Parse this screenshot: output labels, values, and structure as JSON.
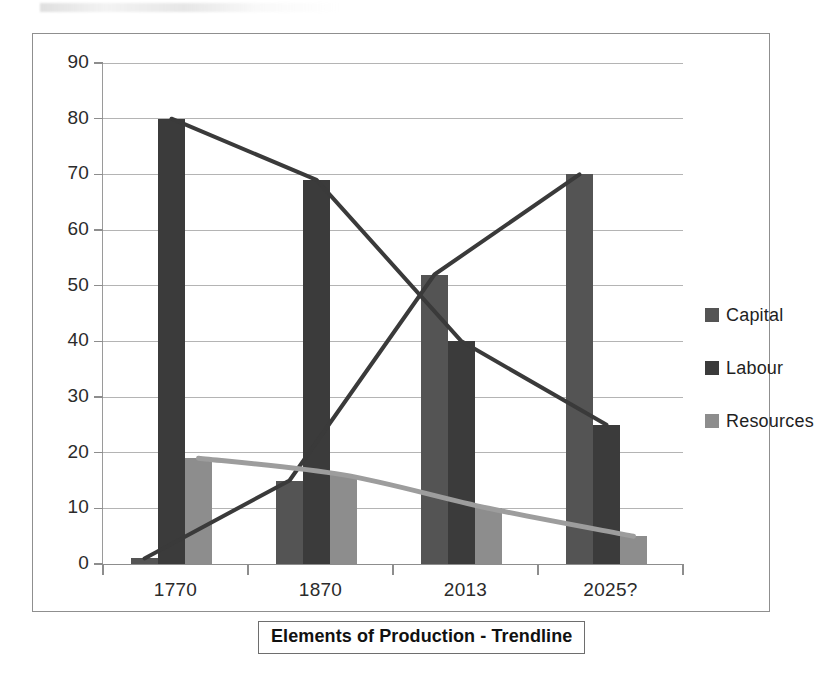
{
  "chart_data": {
    "type": "bar",
    "title": "Elements of Production - Trendline",
    "xlabel": "",
    "ylabel": "",
    "categories": [
      "1770",
      "1870",
      "2013",
      "2025?"
    ],
    "series": [
      {
        "name": "Capital",
        "values": [
          1,
          15,
          52,
          70
        ],
        "color": "#545454"
      },
      {
        "name": "Labour",
        "values": [
          80,
          69,
          40,
          25
        ],
        "color": "#3b3b3b"
      },
      {
        "name": "Resources",
        "values": [
          19,
          16,
          10,
          5
        ],
        "color": "#8d8d8d"
      }
    ],
    "trendlines": [
      {
        "name": "Capital trendline",
        "values": [
          1,
          15,
          52,
          70
        ],
        "color": "#3a3a3a",
        "style": "straight"
      },
      {
        "name": "Labour trendline",
        "values": [
          80,
          69,
          40,
          25
        ],
        "color": "#3a3a3a",
        "style": "straight"
      },
      {
        "name": "Resources trendline",
        "values": [
          19,
          16,
          10,
          5
        ],
        "color": "#9d9d9d",
        "style": "smooth"
      }
    ],
    "ylim": [
      0,
      90
    ],
    "ytick_step": 10,
    "yticks": [
      "90",
      "80",
      "70",
      "60",
      "50",
      "40",
      "30",
      "20",
      "10",
      "0"
    ],
    "grid": true,
    "legend_position": "right"
  },
  "legend": {
    "items": [
      {
        "label": "Capital",
        "color": "#545454"
      },
      {
        "label": "Labour",
        "color": "#3b3b3b"
      },
      {
        "label": "Resources",
        "color": "#8d8d8d"
      }
    ]
  }
}
